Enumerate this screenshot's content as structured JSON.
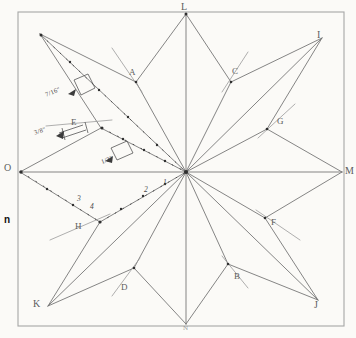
{
  "sheet": {
    "background_color": "#fbfaf7",
    "ink_color": "#6b6b6b",
    "frame_color": "#9a9a9a",
    "width": 356,
    "height": 338
  },
  "frame": {
    "x": 18,
    "y": 12,
    "width": 326,
    "height": 314
  },
  "center_point": {
    "x": 186,
    "y": 172,
    "label": ""
  },
  "outside_marks": [
    {
      "name": "page-mark-n",
      "text": "n",
      "x": 4,
      "y": 215
    }
  ],
  "vertex_labels": [
    {
      "name": "label-L",
      "text": "L",
      "x": 181,
      "y": 2
    },
    {
      "name": "label-I",
      "text": "I",
      "x": 317,
      "y": 30
    },
    {
      "name": "label-M",
      "text": "M",
      "x": 345,
      "y": 166
    },
    {
      "name": "label-J",
      "text": "J",
      "x": 314,
      "y": 308
    },
    {
      "name": "label-K",
      "text": "K",
      "x": 33,
      "y": 303
    },
    {
      "name": "label-O",
      "text": "O",
      "x": 4,
      "y": 165
    },
    {
      "name": "label-H",
      "text": "H",
      "x": 75,
      "y": 224
    },
    {
      "name": "label-D",
      "text": "D",
      "x": 121,
      "y": 287
    },
    {
      "name": "label-B",
      "text": "B",
      "x": 234,
      "y": 277
    },
    {
      "name": "label-F",
      "text": "F",
      "x": 271,
      "y": 222
    },
    {
      "name": "label-G",
      "text": "G",
      "x": 277,
      "y": 121
    },
    {
      "name": "label-C",
      "text": "C",
      "x": 232,
      "y": 71
    },
    {
      "name": "label-A",
      "text": "A",
      "x": 129,
      "y": 72
    },
    {
      "name": "label-E",
      "text": "E",
      "x": 71,
      "y": 122
    }
  ],
  "bottom_label": {
    "name": "label-bottom-vertex",
    "text": "N",
    "x": 183,
    "y": 325
  },
  "tick_numbers": [
    {
      "name": "tick-number-1",
      "text": "1",
      "x": 163,
      "y": 183
    },
    {
      "name": "tick-number-2",
      "text": "2",
      "x": 144,
      "y": 189
    },
    {
      "name": "tick-number-3",
      "text": "3",
      "x": 77,
      "y": 199
    },
    {
      "name": "tick-number-4",
      "text": "4",
      "x": 90,
      "y": 206
    }
  ],
  "dimension_annotations": [
    {
      "name": "dimension-upper-fraction",
      "text": "7/16\"",
      "x": 45,
      "y": 92
    },
    {
      "name": "dimension-lower-fraction",
      "text": "3/8\"",
      "x": 34,
      "y": 131
    },
    {
      "name": "dimension-center-fraction",
      "text": "1/2\"",
      "x": 101,
      "y": 160
    }
  ],
  "geometry": {
    "description": "Eight-pointed star construction: eight outer points connected through a common center, with alternating kite/rhombus facets and short leader lines at each inner vertex.",
    "outer_points": [
      {
        "id": "L",
        "x": 186,
        "y": 14
      },
      {
        "id": "I",
        "x": 322,
        "y": 38
      },
      {
        "id": "M",
        "x": 342,
        "y": 172
      },
      {
        "id": "J",
        "x": 318,
        "y": 300
      },
      {
        "id": "N",
        "x": 186,
        "y": 324
      },
      {
        "id": "K",
        "x": 48,
        "y": 306
      },
      {
        "id": "O",
        "x": 20,
        "y": 172
      },
      {
        "id": "P",
        "x": 40,
        "y": 34
      }
    ],
    "inner_points": [
      {
        "id": "A",
        "x": 136,
        "y": 82
      },
      {
        "id": "C",
        "x": 231,
        "y": 82
      },
      {
        "id": "G",
        "x": 267,
        "y": 129
      },
      {
        "id": "F",
        "x": 265,
        "y": 218
      },
      {
        "id": "B",
        "x": 228,
        "y": 264
      },
      {
        "id": "D",
        "x": 134,
        "y": 268
      },
      {
        "id": "H",
        "x": 100,
        "y": 222
      },
      {
        "id": "E",
        "x": 101,
        "y": 128
      }
    ]
  },
  "dotted_rays": [
    {
      "name": "dotted-ray-upper-left",
      "from": "P",
      "to": "center"
    },
    {
      "name": "dotted-ray-mid-left",
      "from": "E",
      "to": "center"
    },
    {
      "name": "dotted-ray-lower-left",
      "from": "O",
      "to": "H"
    },
    {
      "name": "dotted-ray-lower-center",
      "from": "H",
      "to": "center"
    }
  ]
}
